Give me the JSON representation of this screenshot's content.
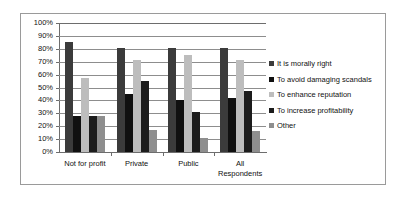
{
  "chart_data": {
    "type": "bar",
    "title": "",
    "xlabel": "",
    "ylabel": "",
    "ylim": [
      0,
      100
    ],
    "y_tick_labels": [
      "100%",
      "90%",
      "80%",
      "70%",
      "60%",
      "50%",
      "40%",
      "30%",
      "20%",
      "10%",
      "0%"
    ],
    "y_tick_values": [
      100,
      90,
      80,
      70,
      60,
      50,
      40,
      30,
      20,
      10,
      0
    ],
    "grid": true,
    "legend_position": "right",
    "categories": [
      "Not for profit",
      "Private",
      "Public",
      "All\nRespondents"
    ],
    "series": [
      {
        "name": "It is morally right",
        "color": "#3b3b3b",
        "values": [
          85,
          81,
          81,
          81
        ]
      },
      {
        "name": "To avoid damaging scandals",
        "color": "#101010",
        "values": [
          28,
          45,
          40,
          42
        ]
      },
      {
        "name": "To enhance reputation",
        "color": "#bdbdbd",
        "values": [
          57,
          71,
          75,
          71
        ]
      },
      {
        "name": "To increase profitability",
        "color": "#1c1c1c",
        "values": [
          28,
          55,
          31,
          47
        ]
      },
      {
        "name": "Other",
        "color": "#8e8e8e",
        "values": [
          28,
          17,
          11,
          16
        ]
      }
    ]
  }
}
